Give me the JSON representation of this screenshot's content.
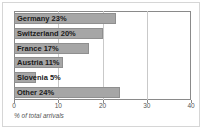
{
  "chart_data": {
    "type": "bar",
    "orientation": "horizontal",
    "title": "",
    "xlabel": "% of total arrivals",
    "ylabel": "",
    "xlim": [
      0,
      40
    ],
    "xticks": [
      0,
      10,
      20,
      30,
      40
    ],
    "xtick_labels": [
      "0",
      "10",
      "20",
      "30",
      "40"
    ],
    "grid": true,
    "legend": false,
    "bar_color": "#a6a6a6",
    "bar_border_color": "#8f8f8f",
    "label_color": "#1a1a1a",
    "categories": [
      "Germany",
      "Switzerland",
      "France",
      "Austria",
      "Slovenia",
      "Other"
    ],
    "values": [
      23,
      20,
      17,
      11,
      5,
      24
    ],
    "bar_labels": [
      "Germany 23%",
      "Switzerland 20%",
      "France 17%",
      "Austria 11%",
      "Slovenia 5%",
      "Other 24%"
    ]
  }
}
